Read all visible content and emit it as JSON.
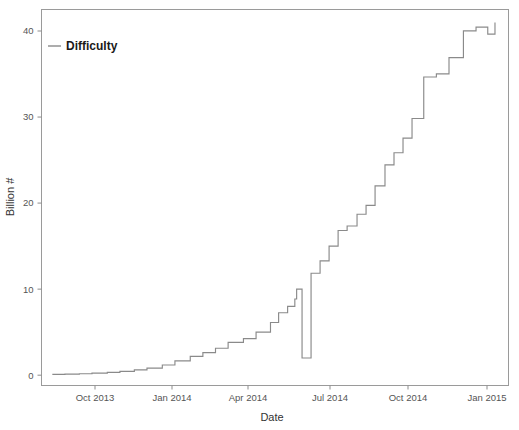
{
  "chart_data": {
    "type": "line",
    "title": "",
    "xlabel": "Date",
    "ylabel": "Billion #",
    "grid": false,
    "legend_position": "top-left",
    "line_color": "#8a8a8a",
    "frame_color": "#9a9a9a",
    "background": "#ffffff",
    "series": [
      {
        "name": "Difficulty",
        "step": "post",
        "x": [
          "2013-09-01",
          "2013-09-15",
          "2013-10-01",
          "2013-10-15",
          "2013-11-01",
          "2013-11-15",
          "2013-12-01",
          "2013-12-15",
          "2014-01-01",
          "2014-01-15",
          "2014-02-01",
          "2014-02-15",
          "2014-03-01",
          "2014-03-15",
          "2014-04-01",
          "2014-04-15",
          "2014-05-01",
          "2014-05-10",
          "2014-05-20",
          "2014-05-28",
          "2014-05-30",
          "2014-06-05",
          "2014-06-15",
          "2014-06-25",
          "2014-07-05",
          "2014-07-15",
          "2014-07-25",
          "2014-08-05",
          "2014-08-15",
          "2014-08-25",
          "2014-09-05",
          "2014-09-15",
          "2014-09-25",
          "2014-10-05",
          "2014-10-18",
          "2014-11-01",
          "2014-11-15",
          "2014-12-01",
          "2014-12-15",
          "2014-12-28",
          "2015-01-05"
        ],
        "values": [
          0.09,
          0.12,
          0.17,
          0.24,
          0.33,
          0.45,
          0.61,
          0.82,
          1.18,
          1.67,
          2.19,
          2.62,
          3.13,
          3.82,
          4.25,
          5.01,
          6.12,
          7.26,
          8.0,
          8.85,
          10.0,
          2.0,
          11.85,
          13.28,
          15.0,
          16.82,
          17.34,
          18.7,
          19.73,
          22.01,
          24.45,
          25.85,
          27.55,
          29.83,
          34.65,
          35.01,
          36.9,
          40.01,
          40.45,
          39.64,
          41.0
        ]
      }
    ],
    "x_axis": {
      "ticks": [
        "Oct 2013",
        "Jan 2014",
        "Apr 2014",
        "Jul 2014",
        "Oct 2014",
        "Jan 2015"
      ],
      "tick_positions": [
        95,
        172,
        248,
        330,
        408,
        487
      ],
      "range_start": "2013-08-20",
      "range_end": "2015-01-20"
    },
    "y_axis": {
      "ticks": [
        "0",
        "10",
        "20",
        "30",
        "40"
      ],
      "tick_values": [
        0,
        10,
        20,
        30,
        40
      ],
      "ylim": [
        -1.2,
        42.5
      ]
    },
    "anomaly": {
      "description": "vertical drop spike",
      "date": "2014-06-05",
      "from_value": 10.0,
      "to_value": 2.0
    }
  },
  "legend": {
    "entries": [
      {
        "label": "Difficulty",
        "color": "#8a8a8a"
      }
    ]
  }
}
